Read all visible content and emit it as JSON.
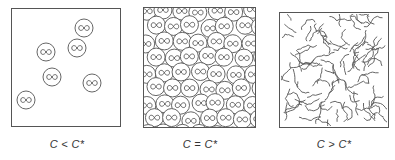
{
  "figure": {
    "panels": [
      {
        "id": "dilute",
        "label": "C < C*",
        "box": {
          "x": 11,
          "y": 8,
          "w": 109,
          "h": 118
        },
        "coils": [
          {
            "cx": 84,
            "cy": 28
          },
          {
            "cx": 46,
            "cy": 52
          },
          {
            "cx": 77,
            "cy": 48
          },
          {
            "cx": 52,
            "cy": 77
          },
          {
            "cx": 92,
            "cy": 83
          },
          {
            "cx": 26,
            "cy": 100
          }
        ]
      },
      {
        "id": "overlap",
        "label": "C = C*",
        "box": {
          "x": 143,
          "y": 7,
          "w": 112,
          "h": 120
        }
      },
      {
        "id": "semidilute",
        "label": "C > C*",
        "box": {
          "x": 279,
          "y": 12,
          "w": 109,
          "h": 115
        }
      }
    ],
    "coil_radius": 9,
    "coil_symbol": "∞",
    "stroke_color": "#555555",
    "background": "#ffffff"
  }
}
